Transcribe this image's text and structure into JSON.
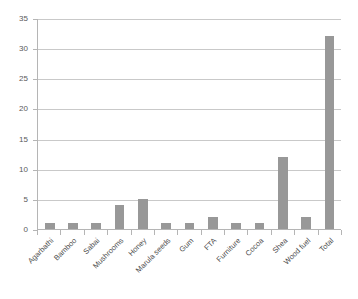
{
  "chart_data": {
    "type": "bar",
    "title": "",
    "subtitle": "",
    "xlabel": "",
    "ylabel": "",
    "categories": [
      "Agarbathi",
      "Bamboo",
      "Sabai",
      "Mushrooms",
      "Honey",
      "Marula seeds",
      "Gum",
      "FTA",
      "Furniture",
      "Cocoa",
      "Shea",
      "Wood fuel",
      "Total"
    ],
    "values": [
      1,
      1,
      1,
      4,
      5,
      1,
      1,
      2,
      1,
      1,
      12,
      2,
      32
    ],
    "ylim": [
      0,
      35
    ],
    "ytick_step": 5,
    "yticks": [
      0,
      5,
      10,
      15,
      20,
      25,
      30,
      35
    ],
    "ytick_labels": [
      "0",
      "5",
      "10",
      "15",
      "20",
      "25",
      "30",
      "35"
    ],
    "grid": true,
    "grid_axis": "y",
    "legend": false,
    "legend_position": "none",
    "bar_color": "#989898",
    "gridline_color": "#c9c9c9",
    "axis_color": "#b5b5b5",
    "background_color": "#ffffff",
    "text_color": "#4d4d4d",
    "xtick_label_rotation": -45
  }
}
